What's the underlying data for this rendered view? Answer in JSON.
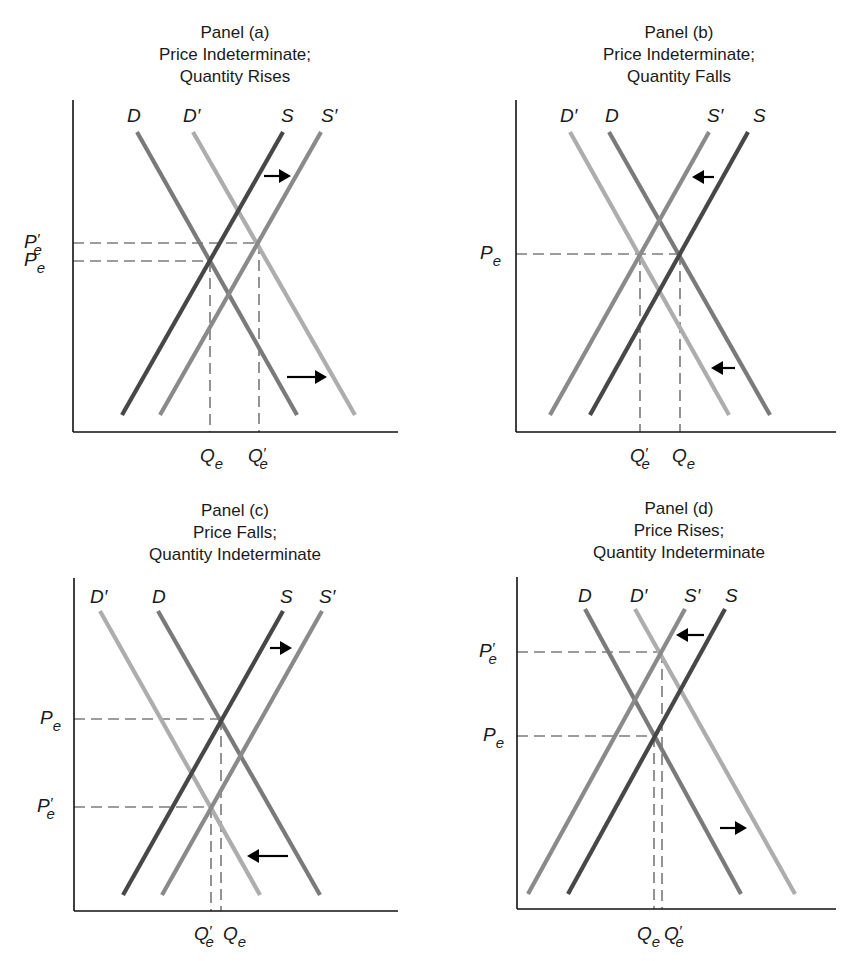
{
  "chart_data": [
    {
      "type": "line",
      "panel": "a",
      "title": "Panel (a)",
      "subtitle": [
        "Price Indeterminate;",
        "Quantity Rises"
      ],
      "xlabel": "",
      "ylabel": "",
      "grid": false,
      "axes": {
        "x0": 73,
        "y_top": 100,
        "y_bottom": 432,
        "x_end": 398
      },
      "curves": [
        {
          "name": "D",
          "label": "D",
          "kind": "demand",
          "color": "#7a7a7a",
          "x1": 137,
          "y1": 132,
          "x2": 297,
          "y2": 415,
          "label_x": 127,
          "label_y": 122
        },
        {
          "name": "D'",
          "label": "D′",
          "kind": "demand-shifted",
          "color": "#adadad",
          "x1": 193,
          "y1": 132,
          "x2": 355,
          "y2": 415,
          "label_x": 183,
          "label_y": 122
        },
        {
          "name": "S",
          "label": "S",
          "kind": "supply",
          "color": "#474747",
          "x1": 122,
          "y1": 415,
          "x2": 283,
          "y2": 132,
          "label_x": 281,
          "label_y": 122
        },
        {
          "name": "S'",
          "label": "S′",
          "kind": "supply-shifted",
          "color": "#8a8a8a",
          "x1": 160,
          "y1": 415,
          "x2": 321,
          "y2": 132,
          "label_x": 321,
          "label_y": 122
        }
      ],
      "price_levels": [
        {
          "label": "P",
          "sub": "e",
          "prime": true,
          "y": 243,
          "x_end": 259,
          "label_x": 24
        },
        {
          "label": "P",
          "sub": "e",
          "prime": false,
          "y": 261,
          "x_end": 210,
          "label_x": 24
        }
      ],
      "quantity_levels": [
        {
          "label": "Q",
          "sub": "e",
          "prime": false,
          "x": 210,
          "y_start": 261,
          "label_x": 200
        },
        {
          "label": "Q",
          "sub": "e",
          "prime": true,
          "x": 259,
          "y_start": 243,
          "label_x": 248
        }
      ],
      "quantity_label_y": 462,
      "arrows": [
        {
          "from_x": 264,
          "to_x": 291,
          "y": 176,
          "direction": "right",
          "meaning": "supply increases"
        },
        {
          "from_x": 287,
          "to_x": 327,
          "y": 377,
          "direction": "right",
          "meaning": "demand increases"
        }
      ],
      "title_pos": {
        "x": 85,
        "y": 22
      }
    },
    {
      "type": "line",
      "panel": "b",
      "title": "Panel (b)",
      "subtitle": [
        "Price Indeterminate;",
        "Quantity Falls"
      ],
      "xlabel": "",
      "ylabel": "",
      "grid": false,
      "axes": {
        "x0": 516,
        "y_top": 100,
        "y_bottom": 432,
        "x_end": 836
      },
      "curves": [
        {
          "name": "D'",
          "label": "D′",
          "kind": "demand-shifted",
          "color": "#adadad",
          "x1": 570,
          "y1": 132,
          "x2": 729,
          "y2": 415,
          "label_x": 560,
          "label_y": 122
        },
        {
          "name": "D",
          "label": "D",
          "kind": "demand",
          "color": "#7a7a7a",
          "x1": 609,
          "y1": 132,
          "x2": 770,
          "y2": 415,
          "label_x": 605,
          "label_y": 122
        },
        {
          "name": "S'",
          "label": "S′",
          "kind": "supply-shifted",
          "color": "#8a8a8a",
          "x1": 550,
          "y1": 415,
          "x2": 709,
          "y2": 132,
          "label_x": 707,
          "label_y": 122
        },
        {
          "name": "S",
          "label": "S",
          "kind": "supply",
          "color": "#474747",
          "x1": 590,
          "y1": 415,
          "x2": 748,
          "y2": 132,
          "label_x": 753,
          "label_y": 122
        }
      ],
      "price_levels": [
        {
          "label": "P",
          "sub": "e",
          "prime": false,
          "y": 254,
          "x_end": 680,
          "label_x": 480
        }
      ],
      "quantity_levels": [
        {
          "label": "Q",
          "sub": "e",
          "prime": true,
          "x": 640,
          "y_start": 254,
          "label_x": 630
        },
        {
          "label": "Q",
          "sub": "e",
          "prime": false,
          "x": 680,
          "y_start": 254,
          "label_x": 672
        }
      ],
      "quantity_label_y": 462,
      "arrows": [
        {
          "from_x": 714,
          "to_x": 692,
          "y": 177,
          "direction": "left",
          "meaning": "supply decreases"
        },
        {
          "from_x": 735,
          "to_x": 711,
          "y": 368,
          "direction": "left",
          "meaning": "demand decreases"
        }
      ],
      "title_pos": {
        "x": 529,
        "y": 22
      }
    },
    {
      "type": "line",
      "panel": "c",
      "title": "Panel (c)",
      "subtitle": [
        "Price Falls;",
        "Quantity Indeterminate"
      ],
      "xlabel": "",
      "ylabel": "",
      "grid": false,
      "axes": {
        "x0": 74,
        "y_top": 578,
        "y_bottom": 911,
        "x_end": 398
      },
      "curves": [
        {
          "name": "D'",
          "label": "D′",
          "kind": "demand-shifted",
          "color": "#adadad",
          "x1": 100,
          "y1": 611,
          "x2": 260,
          "y2": 895,
          "label_x": 90,
          "label_y": 603
        },
        {
          "name": "D",
          "label": "D",
          "kind": "demand",
          "color": "#7a7a7a",
          "x1": 158,
          "y1": 611,
          "x2": 320,
          "y2": 895,
          "label_x": 152,
          "label_y": 603
        },
        {
          "name": "S",
          "label": "S",
          "kind": "supply",
          "color": "#474747",
          "x1": 123,
          "y1": 895,
          "x2": 283,
          "y2": 611,
          "label_x": 280,
          "label_y": 603
        },
        {
          "name": "S'",
          "label": "S′",
          "kind": "supply-shifted",
          "color": "#8a8a8a",
          "x1": 162,
          "y1": 895,
          "x2": 322,
          "y2": 611,
          "label_x": 319,
          "label_y": 603
        }
      ],
      "price_levels": [
        {
          "label": "P",
          "sub": "e",
          "prime": false,
          "y": 719,
          "x_end": 221,
          "label_x": 40
        },
        {
          "label": "P",
          "sub": "e",
          "prime": true,
          "y": 807,
          "x_end": 211,
          "label_x": 37
        }
      ],
      "quantity_levels": [
        {
          "label": "Q",
          "sub": "e",
          "prime": true,
          "x": 211,
          "y_start": 807,
          "label_x": 194
        },
        {
          "label": "Q",
          "sub": "e",
          "prime": false,
          "x": 221,
          "y_start": 719,
          "label_x": 223
        }
      ],
      "quantity_label_y": 940,
      "arrows": [
        {
          "from_x": 270,
          "to_x": 292,
          "y": 648,
          "direction": "right",
          "meaning": "supply increases"
        },
        {
          "from_x": 288,
          "to_x": 247,
          "y": 856,
          "direction": "left",
          "meaning": "demand decreases"
        }
      ],
      "title_pos": {
        "x": 85,
        "y": 500
      }
    },
    {
      "type": "line",
      "panel": "d",
      "title": "Panel (d)",
      "subtitle": [
        "Price Rises;",
        "Quantity Indeterminate"
      ],
      "xlabel": "",
      "ylabel": "",
      "grid": false,
      "axes": {
        "x0": 517,
        "y_top": 577,
        "y_bottom": 909,
        "x_end": 836
      },
      "curves": [
        {
          "name": "D",
          "label": "D",
          "kind": "demand",
          "color": "#7a7a7a",
          "x1": 585,
          "y1": 609,
          "x2": 741,
          "y2": 894,
          "label_x": 578,
          "label_y": 602
        },
        {
          "name": "D'",
          "label": "D′",
          "kind": "demand-shifted",
          "color": "#adadad",
          "x1": 635,
          "y1": 609,
          "x2": 795,
          "y2": 894,
          "label_x": 630,
          "label_y": 602
        },
        {
          "name": "S'",
          "label": "S′",
          "kind": "supply-shifted",
          "color": "#8a8a8a",
          "x1": 528,
          "y1": 894,
          "x2": 685,
          "y2": 609,
          "label_x": 684,
          "label_y": 602
        },
        {
          "name": "S",
          "label": "S",
          "kind": "supply",
          "color": "#474747",
          "x1": 568,
          "y1": 894,
          "x2": 725,
          "y2": 609,
          "label_x": 725,
          "label_y": 602
        }
      ],
      "price_levels": [
        {
          "label": "P",
          "sub": "e",
          "prime": true,
          "y": 652,
          "x_end": 662,
          "label_x": 479
        },
        {
          "label": "P",
          "sub": "e",
          "prime": false,
          "y": 736,
          "x_end": 654,
          "label_x": 483
        }
      ],
      "quantity_levels": [
        {
          "label": "Q",
          "sub": "e",
          "prime": false,
          "x": 654,
          "y_start": 736,
          "label_x": 637
        },
        {
          "label": "Q",
          "sub": "e",
          "prime": true,
          "x": 662,
          "y_start": 652,
          "label_x": 664
        }
      ],
      "quantity_label_y": 940,
      "arrows": [
        {
          "from_x": 704,
          "to_x": 676,
          "y": 635,
          "direction": "left",
          "meaning": "supply decreases"
        },
        {
          "from_x": 720,
          "to_x": 747,
          "y": 828,
          "direction": "right",
          "meaning": "demand increases"
        }
      ],
      "title_pos": {
        "x": 529,
        "y": 498
      }
    }
  ]
}
